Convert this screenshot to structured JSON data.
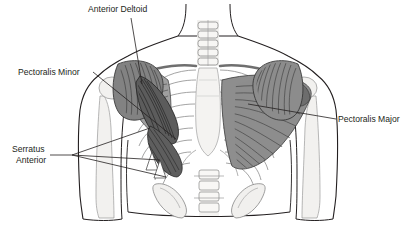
{
  "image": {
    "title": "Anterior chest musculature diagram",
    "width": 416,
    "height": 229,
    "background_color": "#ffffff",
    "line_color": "#231f20",
    "style": "grayscale anatomical line art"
  },
  "labels": {
    "anterior_deltoid": {
      "text": "Anterior Deltoid",
      "x": 88,
      "y": 12,
      "anchor": "start"
    },
    "pectoralis_minor": {
      "text": "Pectoralis Minor",
      "x": 18,
      "y": 75,
      "anchor": "start"
    },
    "serratus_anterior_line1": {
      "text": "Serratus",
      "x": 12,
      "y": 152,
      "anchor": "start"
    },
    "serratus_anterior_line2": {
      "text": "Anterior",
      "x": 16,
      "y": 163,
      "anchor": "start"
    },
    "pectoralis_major": {
      "text": "Pectoralis Major",
      "x": 338,
      "y": 122,
      "anchor": "start"
    }
  },
  "anatomy": {
    "parts": [
      "cervical-spine",
      "clavicle-left",
      "clavicle-right",
      "sternum",
      "ribcage",
      "lumbar-spine",
      "pelvis",
      "deltoid-left",
      "deltoid-right",
      "pectoralis-major-left",
      "pectoralis-major-right",
      "pectoralis-minor-left",
      "serratus-anterior-left",
      "humerus-left",
      "humerus-right",
      "body-outline"
    ],
    "muscle_fill_dark": "#6e6e6e",
    "muscle_fill_mid": "#8d8d8d",
    "bone_fill": "#f0efed",
    "skin_fill": "#ffffff"
  }
}
